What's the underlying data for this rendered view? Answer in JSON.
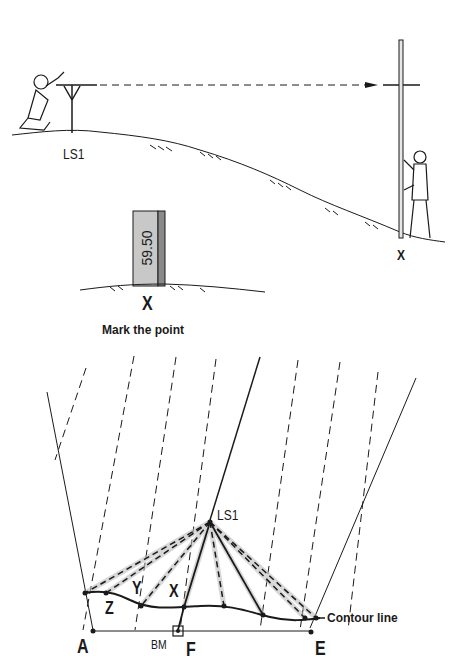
{
  "top_scene": {
    "station_label": "LS1",
    "staff_point_label": "X"
  },
  "marker_scene": {
    "peg_value": "59.50",
    "point_label": "X",
    "caption": "Mark the point"
  },
  "plan_diagram": {
    "station_label": "LS1",
    "point_labels": [
      "Z",
      "Y",
      "X"
    ],
    "corner_a": "A",
    "benchmark": "BM",
    "point_f": "F",
    "corner_e": "E",
    "contour_label": "Contour line"
  },
  "colors": {
    "ink": "#1a1a1a",
    "peg_fill": "#c8c8c8",
    "peg_shade": "#8a8a8a",
    "ray_halo": "#bdbdbd"
  }
}
